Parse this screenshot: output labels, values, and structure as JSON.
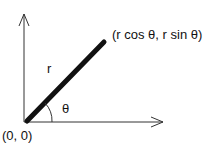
{
  "diagram": {
    "labels": {
      "radius": "r",
      "angle": "θ",
      "point": "(r cos θ, r sin θ)",
      "origin": "(0, 0)"
    },
    "colors": {
      "stroke": "#111111",
      "background": "#ffffff"
    }
  }
}
